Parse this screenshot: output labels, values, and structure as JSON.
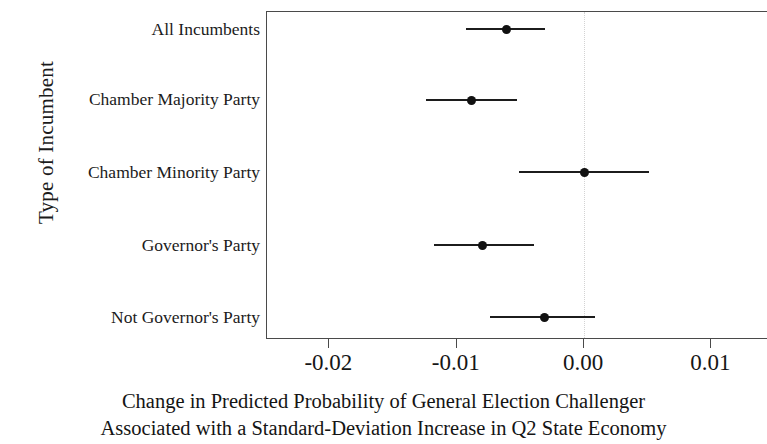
{
  "chart_data": {
    "type": "scatter",
    "subtype": "coefficient-plot-with-confidence-intervals",
    "title": "",
    "xlabel": "Change in Predicted Probability of General Election Challenger Associated with a Standard-Deviation Increase in Q2 State Economy",
    "xlabel_lines": [
      "Change in Predicted Probability of General Election Challenger",
      "Associated with a Standard-Deviation Increase in Q2 State Economy"
    ],
    "ylabel": "Type of Incumbent",
    "categories": [
      "All Incumbents",
      "Chamber Majority Party",
      "Chamber Minority Party",
      "Governor's Party",
      "Not Governor's Party"
    ],
    "values": [
      -0.0061,
      -0.0088,
      0.0,
      -0.008,
      -0.0031
    ],
    "ci_low": [
      -0.0093,
      -0.0124,
      -0.0051,
      -0.0118,
      -0.0074
    ],
    "ci_high": [
      -0.0031,
      -0.0053,
      0.0051,
      -0.0039,
      0.0009
    ],
    "series": [
      {
        "name": "Estimated change in predicted probability",
        "points": [
          {
            "category": "All Incumbents",
            "value": -0.0061,
            "ci_low": -0.0093,
            "ci_high": -0.0031
          },
          {
            "category": "Chamber Majority Party",
            "value": -0.0088,
            "ci_low": -0.0124,
            "ci_high": -0.0053
          },
          {
            "category": "Chamber Minority Party",
            "value": 0.0,
            "ci_low": -0.0051,
            "ci_high": 0.0051
          },
          {
            "category": "Governor's Party",
            "value": -0.008,
            "ci_low": -0.0118,
            "ci_high": -0.0039
          },
          {
            "category": "Not Governor's Party",
            "value": -0.0031,
            "ci_low": -0.0074,
            "ci_high": 0.0009
          }
        ]
      }
    ],
    "xticks": [
      -0.02,
      -0.01,
      0.0,
      0.01
    ],
    "xtick_labels": [
      "-0.02",
      "-0.01",
      "0.00",
      "0.01"
    ],
    "xlim": [
      -0.0249,
      0.0145
    ],
    "ylim_categories_top_to_bottom": true,
    "grid": false,
    "legend": "none",
    "reference_line": {
      "x": 0.0,
      "style": "dotted",
      "color": "#d3d3d3"
    },
    "marker_color": "#111111",
    "ci_color": "#1c1c1c",
    "panel_border_color": "#4a4a4a",
    "background_color": "#ffffff"
  }
}
